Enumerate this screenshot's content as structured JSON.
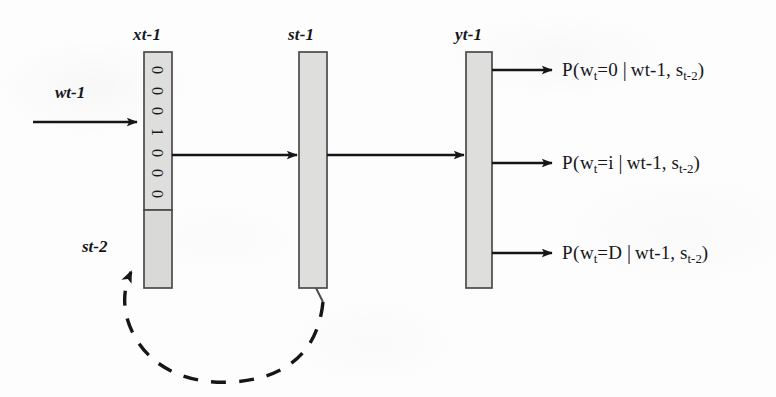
{
  "figure": {
    "type": "neural-network-architecture-diagram",
    "background_color": "#fdfdfd",
    "ink_color": "#16161a",
    "bar_fill_color": "#dededd",
    "bar_stroke_color": "#4a4a4a"
  },
  "labels": {
    "input_arrow": "wt-1",
    "feedback_arrow": "st-2",
    "layer_x": "xt-1",
    "layer_s": "st-1",
    "layer_y": "yt-1"
  },
  "input_layer": {
    "name": "xt-1",
    "bits": [
      "0",
      "0",
      "0",
      "1",
      "0",
      "0",
      "0"
    ],
    "bit_string": "0001000",
    "sections": [
      "word-one-hot-section",
      "state-context-section"
    ]
  },
  "hidden_layer": {
    "name": "st-1"
  },
  "output_layer": {
    "name": "yt-1"
  },
  "outputs": [
    {
      "prefix": "P(",
      "var": "w",
      "var_sub": "t",
      "eq": "=0",
      "bar": "|",
      "cond1": "wt-1",
      "comma": ", ",
      "cond2_var": "s",
      "cond2_sub": "t-2",
      "suffix": ")",
      "full_text": "P(wt=0 | wt-1, st-2)"
    },
    {
      "prefix": "P(",
      "var": "w",
      "var_sub": "t",
      "eq": "=i",
      "bar": "|",
      "cond1": "wt-1",
      "comma": ", ",
      "cond2_var": "s",
      "cond2_sub": "t-2",
      "suffix": ")",
      "full_text": "P(wt=i | wt-1, st-2)"
    },
    {
      "prefix": "P(",
      "var": "w",
      "var_sub": "t",
      "eq": "=D",
      "bar": "|",
      "cond1": "wt-1",
      "comma": ", ",
      "cond2_var": "s",
      "cond2_sub": "t-2",
      "suffix": ")",
      "full_text": "P(wt=D | wt-1, st-2)"
    }
  ]
}
